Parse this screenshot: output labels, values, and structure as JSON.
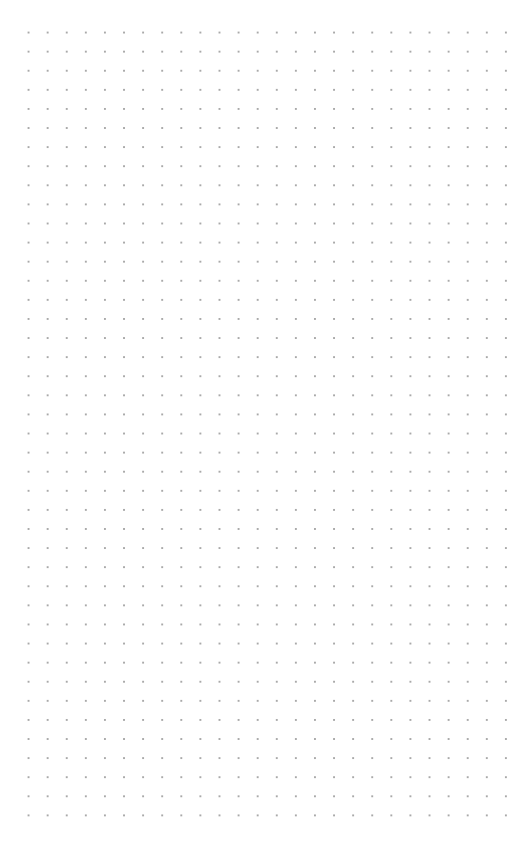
{
  "canvas": {
    "type": "dot-grid",
    "background_color": "#ffffff",
    "dot_color": "#a9a9a9",
    "grid_spacing_px": 19,
    "first_dot": [
      29,
      33
    ],
    "columns": 26,
    "rows": 42,
    "content": []
  }
}
